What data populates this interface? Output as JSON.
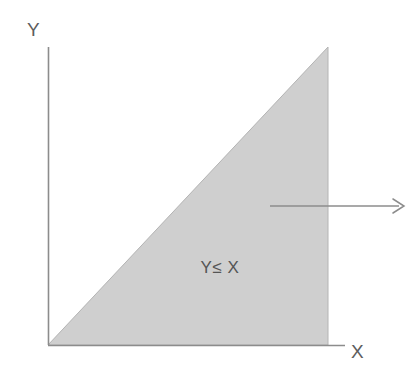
{
  "figure": {
    "title": "",
    "background_color": "#ffffff",
    "axes": {
      "y_label": "Y",
      "x_label": "X",
      "axis_color": "#8c8c8c",
      "origin": {
        "x": 48,
        "y": 345
      },
      "y_axis_top": {
        "x": 48,
        "y": 47
      },
      "x_axis_right": {
        "x": 345,
        "y": 345
      }
    },
    "shaded_region": {
      "name": "feasible-region-triangle",
      "label": "Y≤ X",
      "fill_color": "#cfcfcf",
      "edge_color": "#b4b4b4",
      "vertices": [
        {
          "x": 48,
          "y": 345
        },
        {
          "x": 328,
          "y": 345
        },
        {
          "x": 328,
          "y": 47
        }
      ],
      "label_position": {
        "x": 220,
        "y": 268
      }
    },
    "annotation_arrow": {
      "name": "region-direction-arrow",
      "color": "#8c8c8c",
      "start": {
        "x": 270,
        "y": 206
      },
      "end": {
        "x": 404,
        "y": 206
      },
      "head_size": 8
    }
  },
  "chart_data": {
    "type": "area",
    "title": "",
    "xlabel": "X",
    "ylabel": "Y",
    "xlim": [
      0,
      1
    ],
    "ylim": [
      0,
      1
    ],
    "grid": false,
    "legend": null,
    "annotations": [
      {
        "text": "Y≤ X",
        "x": 0.61,
        "y": 0.26,
        "role": "region-inequality-label"
      },
      {
        "text": "",
        "role": "direction-arrow",
        "x_start": 0.79,
        "x_end": 1.27,
        "y": 0.47
      }
    ],
    "series": [
      {
        "name": "Y ≤ X region boundary",
        "x": [
          0,
          1
        ],
        "values": [
          0,
          1
        ],
        "fill_to": 0,
        "fill_color": "#cfcfcf",
        "description": "Region below the line Y = X, bounded on the right by X = 1 and below by Y = 0"
      }
    ]
  }
}
